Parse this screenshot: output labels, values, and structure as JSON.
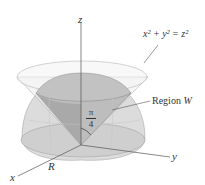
{
  "figure": {
    "axes": {
      "x": "x",
      "y": "y",
      "z": "z"
    },
    "equation_label": "x² + y² = z²",
    "region_label": "Region",
    "region_symbol": "W",
    "angle_numerator": "π",
    "angle_denominator": "4",
    "radius_label": "R"
  },
  "colors": {
    "surface_fill": "#d4d4d4",
    "surface_dark": "#a8a8a8",
    "cone_fill": "#e6e6e6",
    "line": "#555555",
    "grid": "#bdbdbd"
  }
}
